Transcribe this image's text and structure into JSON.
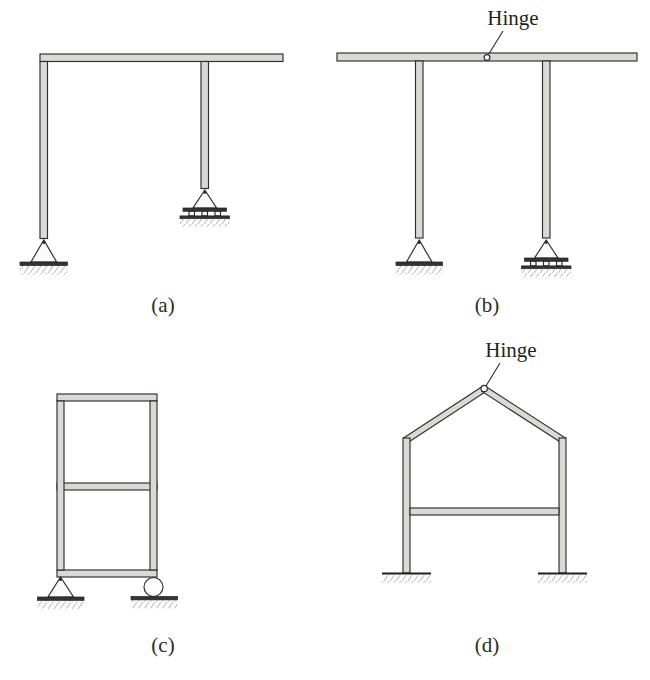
{
  "figure": {
    "background_color": "#ffffff",
    "member_fill_color": "#d9d9d6",
    "member_outline_color": "#2e2e2e",
    "text_color": "#1f1f1f",
    "width": 650,
    "height": 680
  },
  "panels": [
    {
      "id": "a",
      "caption": "(a)",
      "caption_x": 163,
      "caption_y": 312,
      "description": "Cantilever beam on two columns, pin support at left base, rocker support at right base",
      "supports": [
        {
          "type": "pin",
          "x": 46,
          "y": 252
        },
        {
          "type": "rocker",
          "x": 205,
          "y": 202
        }
      ],
      "hinges": []
    },
    {
      "id": "b",
      "caption": "(b)",
      "caption_x": 487,
      "caption_y": 312,
      "description": "Beam with internal hinge on two columns, pin support at left base, rocker support at right base",
      "supports": [
        {
          "type": "pin",
          "x": 419,
          "y": 252
        },
        {
          "type": "rocker",
          "x": 546,
          "y": 252
        }
      ],
      "hinges": [
        {
          "label": "Hinge",
          "x": 487,
          "y": 61,
          "label_x": 513,
          "label_y": 24
        }
      ]
    },
    {
      "id": "c",
      "caption": "(c)",
      "caption_x": 163,
      "caption_y": 652,
      "description": "Two-story single-bay rigid frame, pin support at left base, roller support at right base",
      "supports": [
        {
          "type": "pin",
          "x": 63,
          "y": 578
        },
        {
          "type": "roller",
          "x": 153,
          "y": 578
        }
      ],
      "hinges": []
    },
    {
      "id": "d",
      "caption": "(d)",
      "caption_x": 487,
      "caption_y": 652,
      "description": "Gable frame with hinge at apex, fixed supports at both bases",
      "supports": [
        {
          "type": "fixed",
          "x": 406,
          "y": 573
        },
        {
          "type": "fixed",
          "x": 563,
          "y": 573
        }
      ],
      "hinges": [
        {
          "label": "Hinge",
          "x": 484,
          "y": 386,
          "label_x": 504,
          "label_y": 356
        }
      ]
    }
  ],
  "legend_terms": {
    "hinge": "Hinge",
    "pin_support": "pin support",
    "roller_support": "roller support",
    "rocker_support": "rocker support",
    "fixed_support": "fixed support"
  }
}
